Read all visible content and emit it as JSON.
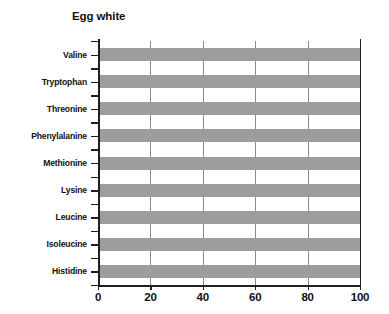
{
  "chart_data": {
    "type": "bar",
    "orientation": "horizontal",
    "title": "Egg white",
    "xlabel": "",
    "ylabel": "",
    "categories": [
      "Valine",
      "Tryptophan",
      "Threonine",
      "Phenylalanine",
      "Methionine",
      "Lysine",
      "Leucine",
      "Isoleucine",
      "Histidine"
    ],
    "values": [
      100,
      100,
      100,
      100,
      100,
      100,
      100,
      100,
      100
    ],
    "xticks": [
      "0",
      "20",
      "40",
      "60",
      "80",
      "100"
    ],
    "xtick_values": [
      0,
      20,
      40,
      60,
      80,
      100
    ],
    "xlim": [
      0,
      100
    ],
    "grid": "vertical",
    "legend": "none",
    "bar_color": "#9d9d9d",
    "axis_color": "#1f1f1f",
    "gridline_color": "#8b8b8b"
  }
}
